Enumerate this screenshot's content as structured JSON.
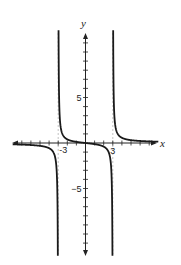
{
  "chart_data": {
    "type": "line",
    "title": "",
    "xlabel": "x",
    "ylabel": "y",
    "function": "y = x / (x^2 - 9)",
    "vertical_asymptotes": [
      -3,
      3
    ],
    "horizontal_asymptote": 0,
    "xlim": [
      -8,
      8
    ],
    "ylim": [
      -12.4,
      12.4
    ],
    "x_tick_step": 1,
    "y_tick_step": 1,
    "x_tick_labels": [
      {
        "value": -3,
        "label": "-3"
      },
      {
        "value": 3,
        "label": "3"
      }
    ],
    "y_tick_labels": [
      {
        "value": 5,
        "label": "5"
      },
      {
        "value": -5,
        "label": "−5"
      }
    ],
    "series": [
      {
        "name": "left branch",
        "x_range": [
          -8,
          -3.04
        ]
      },
      {
        "name": "middle branch",
        "x_range": [
          -2.963,
          2.963
        ]
      },
      {
        "name": "right branch",
        "x_range": [
          3.04,
          8
        ]
      }
    ],
    "grid": false,
    "legend": null
  },
  "layout": {
    "origin_px": [
      85.5,
      143
    ],
    "unit_px": 9.1,
    "x_axis_px": [
      12,
      157
    ],
    "y_axis_px": [
      33,
      256
    ],
    "curve_color": "#1a1a1a",
    "axis_color": "#222222",
    "asymptote_color": "#9a9a9a"
  },
  "labels": {
    "x_axis": "x",
    "y_axis": "y",
    "x_neg3": "-3",
    "x_pos3": "3",
    "y_pos5": "5",
    "y_neg5": "−5"
  }
}
